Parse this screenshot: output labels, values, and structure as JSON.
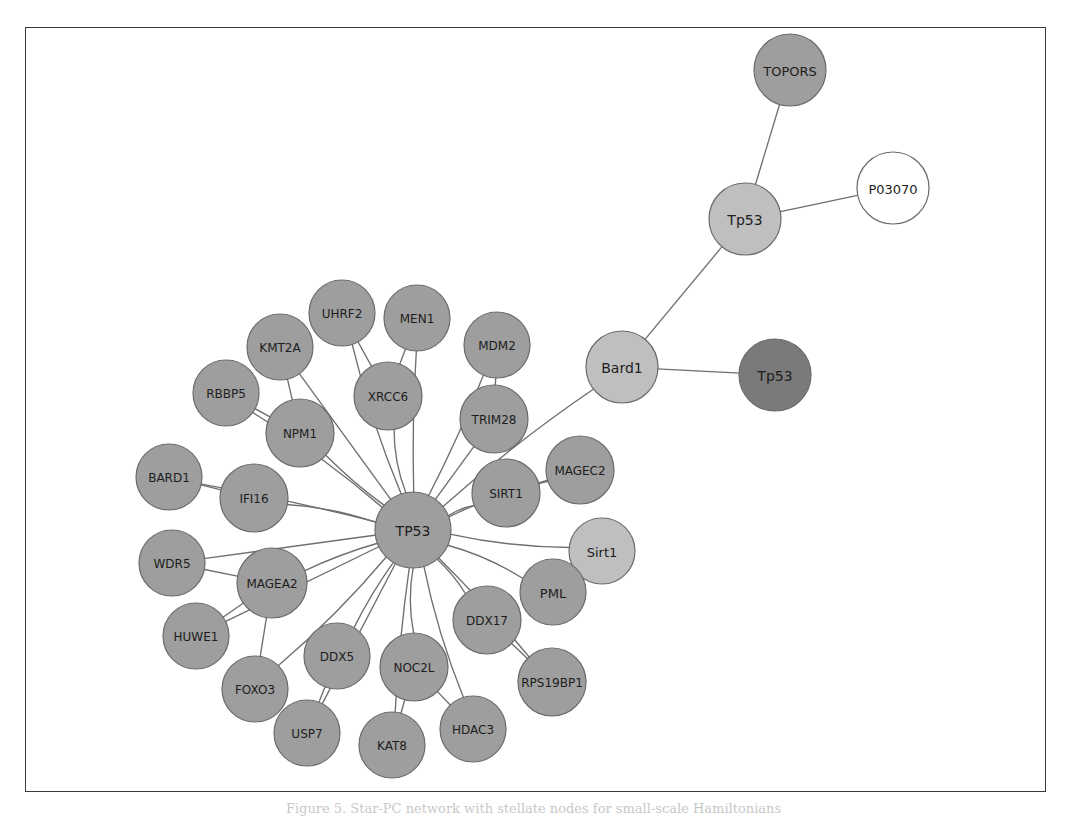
{
  "figure": {
    "caption": "Figure 5. Star-PC network with stellate nodes for small-scale Hamiltonians",
    "background_color": "#ffffff",
    "frame_color": "#3a3a3a",
    "edge_color": "#6f6f6f"
  },
  "palette": {
    "medium_gray": "#9e9e9e",
    "light_gray": "#bfbfbf",
    "dark_gray": "#7a7a7a",
    "white": "#ffffff",
    "node_stroke": "#6b6b6b"
  },
  "chart_data": {
    "type": "diagram",
    "subtype": "network-graph",
    "node_count": 33,
    "edge_count": 39,
    "nodes": [
      {
        "id": "TOPORS",
        "label": "TOPORS",
        "x": 790,
        "y": 70,
        "r": 36,
        "fill": "#9e9e9e",
        "font": 13
      },
      {
        "id": "P03070",
        "label": "P03070",
        "x": 893,
        "y": 188,
        "r": 36,
        "fill": "#ffffff",
        "font": 13
      },
      {
        "id": "Tp53_top",
        "label": "Tp53",
        "x": 745,
        "y": 219,
        "r": 36,
        "fill": "#bfbfbf",
        "font": 14
      },
      {
        "id": "Bard1",
        "label": "Bard1",
        "x": 622,
        "y": 367,
        "r": 36,
        "fill": "#bfbfbf",
        "font": 14
      },
      {
        "id": "Tp53_dark",
        "label": "Tp53",
        "x": 775,
        "y": 375,
        "r": 36,
        "fill": "#7a7a7a",
        "font": 14
      },
      {
        "id": "TP53",
        "label": "TP53",
        "x": 413,
        "y": 530,
        "r": 38,
        "fill": "#9e9e9e",
        "font": 14
      },
      {
        "id": "UHRF2",
        "label": "UHRF2",
        "x": 342,
        "y": 313,
        "r": 33,
        "fill": "#9e9e9e",
        "font": 12
      },
      {
        "id": "MEN1",
        "label": "MEN1",
        "x": 417,
        "y": 318,
        "r": 33,
        "fill": "#9e9e9e",
        "font": 12
      },
      {
        "id": "KMT2A",
        "label": "KMT2A",
        "x": 280,
        "y": 347,
        "r": 33,
        "fill": "#9e9e9e",
        "font": 12
      },
      {
        "id": "MDM2",
        "label": "MDM2",
        "x": 497,
        "y": 345,
        "r": 33,
        "fill": "#9e9e9e",
        "font": 12
      },
      {
        "id": "RBBP5",
        "label": "RBBP5",
        "x": 226,
        "y": 393,
        "r": 33,
        "fill": "#9e9e9e",
        "font": 12
      },
      {
        "id": "XRCC6",
        "label": "XRCC6",
        "x": 388,
        "y": 396,
        "r": 34,
        "fill": "#9e9e9e",
        "font": 12
      },
      {
        "id": "NPM1",
        "label": "NPM1",
        "x": 300,
        "y": 433,
        "r": 34,
        "fill": "#9e9e9e",
        "font": 12
      },
      {
        "id": "TRIM28",
        "label": "TRIM28",
        "x": 494,
        "y": 419,
        "r": 34,
        "fill": "#9e9e9e",
        "font": 12
      },
      {
        "id": "BARD1",
        "label": "BARD1",
        "x": 169,
        "y": 477,
        "r": 33,
        "fill": "#9e9e9e",
        "font": 12
      },
      {
        "id": "IFI16",
        "label": "IFI16",
        "x": 254,
        "y": 498,
        "r": 34,
        "fill": "#9e9e9e",
        "font": 12
      },
      {
        "id": "MAGEC2",
        "label": "MAGEC2",
        "x": 580,
        "y": 470,
        "r": 34,
        "fill": "#9e9e9e",
        "font": 12
      },
      {
        "id": "SIRT1",
        "label": "SIRT1",
        "x": 506,
        "y": 493,
        "r": 34,
        "fill": "#9e9e9e",
        "font": 12
      },
      {
        "id": "WDR5",
        "label": "WDR5",
        "x": 172,
        "y": 563,
        "r": 33,
        "fill": "#9e9e9e",
        "font": 12
      },
      {
        "id": "MAGEA2",
        "label": "MAGEA2",
        "x": 272,
        "y": 583,
        "r": 35,
        "fill": "#9e9e9e",
        "font": 12
      },
      {
        "id": "Sirt1",
        "label": "Sirt1",
        "x": 602,
        "y": 551,
        "r": 33,
        "fill": "#bfbfbf",
        "font": 13
      },
      {
        "id": "PML",
        "label": "PML",
        "x": 553,
        "y": 592,
        "r": 33,
        "fill": "#9e9e9e",
        "font": 13
      },
      {
        "id": "DDX17",
        "label": "DDX17",
        "x": 487,
        "y": 620,
        "r": 34,
        "fill": "#9e9e9e",
        "font": 12
      },
      {
        "id": "HUWE1",
        "label": "HUWE1",
        "x": 196,
        "y": 636,
        "r": 33,
        "fill": "#9e9e9e",
        "font": 12
      },
      {
        "id": "DDX5",
        "label": "DDX5",
        "x": 337,
        "y": 656,
        "r": 33,
        "fill": "#9e9e9e",
        "font": 12
      },
      {
        "id": "NOC2L",
        "label": "NOC2L",
        "x": 414,
        "y": 667,
        "r": 34,
        "fill": "#9e9e9e",
        "font": 12
      },
      {
        "id": "FOXO3",
        "label": "FOXO3",
        "x": 255,
        "y": 689,
        "r": 33,
        "fill": "#9e9e9e",
        "font": 12
      },
      {
        "id": "RPS19BP1",
        "label": "RPS19BP1",
        "x": 552,
        "y": 682,
        "r": 34,
        "fill": "#9e9e9e",
        "font": 12
      },
      {
        "id": "USP7",
        "label": "USP7",
        "x": 307,
        "y": 733,
        "r": 33,
        "fill": "#9e9e9e",
        "font": 12
      },
      {
        "id": "KAT8",
        "label": "KAT8",
        "x": 392,
        "y": 745,
        "r": 33,
        "fill": "#9e9e9e",
        "font": 12
      },
      {
        "id": "HDAC3",
        "label": "HDAC3",
        "x": 473,
        "y": 729,
        "r": 33,
        "fill": "#9e9e9e",
        "font": 12
      }
    ],
    "edges": [
      {
        "source": "TOPORS",
        "target": "Tp53_top"
      },
      {
        "source": "Tp53_top",
        "target": "P03070"
      },
      {
        "source": "Tp53_top",
        "target": "Bard1"
      },
      {
        "source": "Bard1",
        "target": "Tp53_dark"
      },
      {
        "source": "Bard1",
        "target": "TP53"
      },
      {
        "source": "TP53",
        "target": "UHRF2"
      },
      {
        "source": "TP53",
        "target": "MEN1"
      },
      {
        "source": "TP53",
        "target": "KMT2A"
      },
      {
        "source": "TP53",
        "target": "MDM2"
      },
      {
        "source": "TP53",
        "target": "RBBP5"
      },
      {
        "source": "TP53",
        "target": "XRCC6"
      },
      {
        "source": "TP53",
        "target": "NPM1"
      },
      {
        "source": "TP53",
        "target": "TRIM28"
      },
      {
        "source": "TP53",
        "target": "BARD1"
      },
      {
        "source": "TP53",
        "target": "IFI16"
      },
      {
        "source": "TP53",
        "target": "MAGEC2"
      },
      {
        "source": "TP53",
        "target": "SIRT1"
      },
      {
        "source": "TP53",
        "target": "WDR5"
      },
      {
        "source": "TP53",
        "target": "MAGEA2"
      },
      {
        "source": "TP53",
        "target": "Sirt1"
      },
      {
        "source": "TP53",
        "target": "PML"
      },
      {
        "source": "TP53",
        "target": "DDX17"
      },
      {
        "source": "TP53",
        "target": "HUWE1"
      },
      {
        "source": "TP53",
        "target": "DDX5"
      },
      {
        "source": "TP53",
        "target": "NOC2L"
      },
      {
        "source": "TP53",
        "target": "FOXO3"
      },
      {
        "source": "TP53",
        "target": "RPS19BP1"
      },
      {
        "source": "TP53",
        "target": "USP7"
      },
      {
        "source": "TP53",
        "target": "KAT8"
      },
      {
        "source": "TP53",
        "target": "HDAC3"
      },
      {
        "source": "XRCC6",
        "target": "UHRF2"
      },
      {
        "source": "XRCC6",
        "target": "MEN1"
      },
      {
        "source": "NPM1",
        "target": "KMT2A"
      },
      {
        "source": "NPM1",
        "target": "RBBP5"
      },
      {
        "source": "IFI16",
        "target": "BARD1"
      },
      {
        "source": "MAGEA2",
        "target": "WDR5"
      },
      {
        "source": "MAGEA2",
        "target": "HUWE1"
      },
      {
        "source": "MAGEA2",
        "target": "FOXO3"
      },
      {
        "source": "DDX5",
        "target": "USP7"
      },
      {
        "source": "NOC2L",
        "target": "KAT8"
      },
      {
        "source": "NOC2L",
        "target": "HDAC3"
      },
      {
        "source": "DDX17",
        "target": "RPS19BP1"
      },
      {
        "source": "SIRT1",
        "target": "MAGEC2"
      },
      {
        "source": "TRIM28",
        "target": "MDM2"
      }
    ]
  }
}
